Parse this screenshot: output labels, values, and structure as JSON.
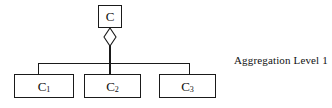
{
  "diagram": {
    "type": "uml-aggregation",
    "background_color": "#ffffff",
    "line_color": "#1a1a1a",
    "text_color": "#111111",
    "root": {
      "label": "C",
      "shape": "rectangle"
    },
    "relationship": {
      "kind": "aggregation",
      "symbol": "hollow-diamond",
      "symbol_fill": "#ffffff"
    },
    "children": [
      {
        "label": "C",
        "subscript": "1",
        "shape": "rectangle"
      },
      {
        "label": "C",
        "subscript": "2",
        "shape": "rectangle"
      },
      {
        "label": "C",
        "subscript": "3",
        "shape": "rectangle"
      }
    ]
  },
  "caption": {
    "text": "Aggregation Level 1"
  }
}
